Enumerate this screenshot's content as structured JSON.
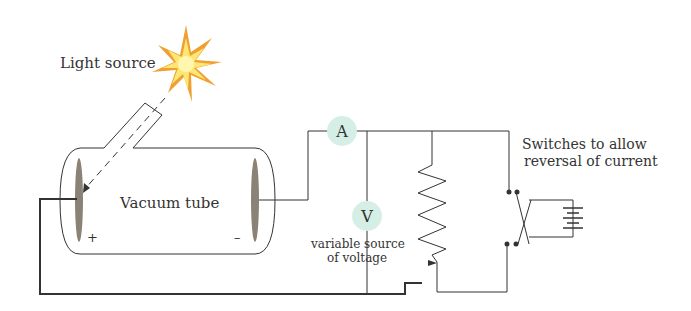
{
  "diagram": {
    "labels": {
      "light_source": "Light source",
      "vacuum_tube": "Vacuum tube",
      "anode_sign": "+",
      "cathode_sign": "–",
      "ammeter": "A",
      "voltmeter": "V",
      "variable_source_line1": "variable source",
      "variable_source_line2": "of voltage",
      "switches_line1": "Switches to allow",
      "switches_line2": "reversal of current"
    },
    "colors": {
      "wire": "#333333",
      "meter_fill": "#d6efe6",
      "electrode": "#8a8275",
      "star_outer": "#f0a030",
      "star_inner": "#fde774"
    }
  }
}
